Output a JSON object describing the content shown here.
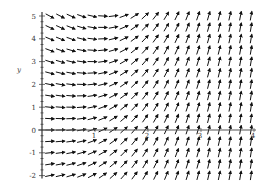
{
  "chart_data": {
    "type": "direction-field",
    "title": "",
    "equation_estimate": "dy/dx = x^2 - y/4",
    "xlabel": "",
    "ylabel": "y",
    "xlim": [
      0,
      4
    ],
    "ylim": [
      -2,
      5
    ],
    "x_ticks": [
      1,
      2,
      3,
      4
    ],
    "x_tick_labels": [
      "1",
      "2",
      "3",
      "4"
    ],
    "y_ticks": [
      -2,
      -1,
      0,
      1,
      2,
      3,
      4,
      5
    ],
    "y_tick_labels": [
      "-2",
      "-1",
      "0",
      "1",
      "2",
      "3",
      "4",
      "5"
    ],
    "grid": false,
    "legend": null,
    "field": {
      "x_start": 0.05,
      "x_end": 4.0,
      "x_step": 0.2,
      "y_start": -2.0,
      "y_end": 5.0,
      "y_step": 0.25
    },
    "observations": [
      "At y=5 arrows point down-right for small x and become horizontal near x≈1.1",
      "Along y=0 near x=0 arrows are nearly horizontal",
      "For x>2 all arrows point nearly straight up (steep positive slope)",
      "Below the x-axis, slopes are positive everywhere"
    ]
  },
  "colors": {
    "arrow": "#111111",
    "axis": "#555555",
    "background": "#ffffff"
  },
  "plot_geometry": {
    "origin_px": [
      42,
      130
    ],
    "px_per_x": 53,
    "px_per_y": 22.8
  }
}
